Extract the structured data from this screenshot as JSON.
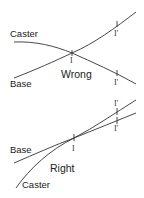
{
  "diagrams": [
    {
      "id": "wrong",
      "title": "Wrong",
      "curves": [
        {
          "name": "Caster",
          "label": "Caster"
        },
        {
          "name": "Base",
          "label": "Base"
        }
      ],
      "markers": {
        "intersection": "I",
        "upper_prime": "I'",
        "lower_prime": "I'"
      }
    },
    {
      "id": "right",
      "title": "Right",
      "curves": [
        {
          "name": "Base",
          "label": "Base"
        },
        {
          "name": "Caster",
          "label": "Caster"
        }
      ],
      "markers": {
        "tangent": "I",
        "upper_prime": "I'",
        "lower_prime": "I'"
      }
    }
  ],
  "colors": {
    "line": "#333333",
    "text": "#222222",
    "background": "#ffffff"
  }
}
